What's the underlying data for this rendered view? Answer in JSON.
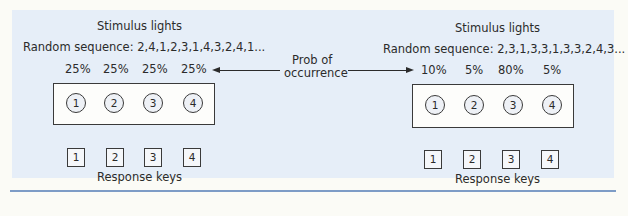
{
  "left": {
    "title": "Stimulus lights",
    "sequence": "Random sequence: 2,4,1,2,3,1,4,3,2,4,1...",
    "probs": [
      "25%",
      "25%",
      "25%",
      "25%"
    ],
    "lights": [
      "1",
      "2",
      "3",
      "4"
    ],
    "keys": [
      "1",
      "2",
      "3",
      "4"
    ],
    "keys_label": "Response keys"
  },
  "center": {
    "label_line1": "Prob of",
    "label_line2": "occurrence"
  },
  "right": {
    "title": "Stimulus lights",
    "sequence": "Random sequence: 2,3,1,3,3,1,3,3,2,4,3...",
    "probs": [
      "10%",
      "5%",
      "80%",
      "5%"
    ],
    "lights": [
      "1",
      "2",
      "3",
      "4"
    ],
    "keys": [
      "1",
      "2",
      "3",
      "4"
    ],
    "keys_label": "Response keys"
  },
  "colors": {
    "panel_bg": "#e6eef8",
    "rule": "#7d9cc6"
  }
}
